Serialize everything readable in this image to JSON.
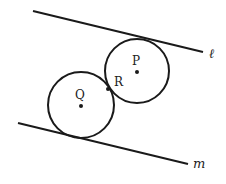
{
  "diagram": {
    "colors": {
      "stroke": "#1a1a1a",
      "background": "#ffffff"
    },
    "lines": [
      {
        "name": "l",
        "label": "ℓ",
        "x1": 33,
        "y1": 11,
        "x2": 203,
        "y2": 52,
        "label_x": 209,
        "label_y": 58
      },
      {
        "name": "m",
        "label": "m",
        "x1": 18,
        "y1": 123,
        "x2": 188,
        "y2": 164,
        "label_x": 193,
        "label_y": 168
      }
    ],
    "circles": [
      {
        "name": "P",
        "label": "P",
        "cx": 137,
        "cy": 71,
        "r": 32,
        "label_x": 132,
        "label_y": 65
      },
      {
        "name": "Q",
        "label": "Q",
        "cx": 81,
        "cy": 105,
        "r": 33,
        "label_x": 75,
        "label_y": 99
      }
    ],
    "points": [
      {
        "name": "R",
        "label": "R",
        "x": 108,
        "y": 89,
        "label_x": 114,
        "label_y": 86
      }
    ]
  }
}
